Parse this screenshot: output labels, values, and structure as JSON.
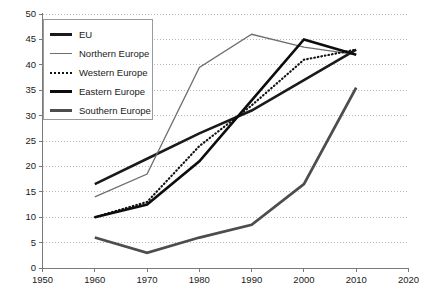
{
  "chart_data": {
    "type": "line",
    "title": "",
    "subtitle": "",
    "xlabel": "",
    "ylabel": "",
    "xlim": [
      1950,
      2020
    ],
    "ylim": [
      0,
      50
    ],
    "x": [
      1960,
      1970,
      1980,
      1990,
      2000,
      2010
    ],
    "xticks": [
      "1950",
      "1960",
      "1970",
      "1980",
      "1990",
      "2000",
      "2010",
      "2020"
    ],
    "xtick_values": [
      1950,
      1960,
      1970,
      1980,
      1990,
      2000,
      2010,
      2020
    ],
    "yticks": [
      "0",
      "5",
      "10",
      "15",
      "20",
      "25",
      "30",
      "35",
      "40",
      "45",
      "50"
    ],
    "ytick_values": [
      0,
      5,
      10,
      15,
      20,
      25,
      30,
      35,
      40,
      45,
      50
    ],
    "grid": "horizontal-dotted",
    "legend_position": "upper-left-inside",
    "series": [
      {
        "name": "EU",
        "values": [
          16.5,
          21.5,
          26.5,
          31,
          37,
          43
        ],
        "color": "#1a1a1a",
        "width": 2.6,
        "dash": "solid"
      },
      {
        "name": "Northern Europe",
        "values": [
          14,
          18.5,
          39.5,
          46,
          43.5,
          42
        ],
        "color": "#6e6e6e",
        "width": 1.3,
        "dash": "solid"
      },
      {
        "name": "Western Europe",
        "values": [
          10,
          13,
          24,
          32,
          41,
          43
        ],
        "color": "#141414",
        "width": 2.2,
        "dash": "dotted"
      },
      {
        "name": "Eastern Europe",
        "values": [
          10,
          12.5,
          21,
          33,
          45,
          42
        ],
        "color": "#0d0d0d",
        "width": 2.6,
        "dash": "solid"
      },
      {
        "name": "Southern Europe",
        "values": [
          6,
          3,
          6,
          8.5,
          16.5,
          35.5
        ],
        "color": "#4d4d4d",
        "width": 2.8,
        "dash": "solid"
      }
    ]
  },
  "legend": {
    "items": [
      {
        "label": "EU",
        "swatch": "thick-black-line-icon"
      },
      {
        "label": "Northern Europe",
        "swatch": "thin-gray-line-icon"
      },
      {
        "label": "Western Europe",
        "swatch": "dotted-black-line-icon"
      },
      {
        "label": "Eastern Europe",
        "swatch": "thick-black-line-icon"
      },
      {
        "label": "Southern Europe",
        "swatch": "thick-gray-line-icon"
      }
    ]
  },
  "axes": {
    "grid_color": "#b9b9b9",
    "axis_color": "#7a7a7a",
    "text_color": "#1a1a1a"
  }
}
